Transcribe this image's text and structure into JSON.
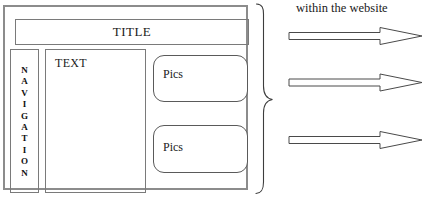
{
  "diagram": {
    "wireframe": {
      "name": "website-page-mock",
      "header": {
        "label": "TITLE"
      },
      "navigation": {
        "label": "NAVIGATION",
        "letters": [
          "N",
          "A",
          "V",
          "I",
          "G",
          "A",
          "T",
          "I",
          "O",
          "N"
        ]
      },
      "content": {
        "label": "TEXT"
      },
      "media_blocks": [
        {
          "label": "Pics"
        },
        {
          "label": "Pics"
        }
      ]
    },
    "annotation": {
      "caption": "within the website",
      "brace": "right-curly-brace",
      "arrows": [
        {
          "name": "arrow-1",
          "direction": "right"
        },
        {
          "name": "arrow-2",
          "direction": "right"
        },
        {
          "name": "arrow-3",
          "direction": "right"
        }
      ]
    },
    "colors": {
      "outer_border": "#8c8c8c",
      "inner_border": "#7a7a7a",
      "stroke": "#4a4a4a",
      "text": "#1a1a1a",
      "background": "#ffffff"
    }
  }
}
